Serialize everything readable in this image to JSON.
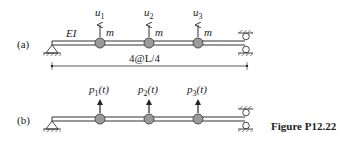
{
  "figure": {
    "caption": "Figure P12.22",
    "part_a": {
      "label": "(a)",
      "stiffness_label": "EI",
      "dofs": [
        {
          "name": "u",
          "sub": "1",
          "mass": "m"
        },
        {
          "name": "u",
          "sub": "2",
          "mass": "m"
        },
        {
          "name": "u",
          "sub": "3",
          "mass": "m"
        }
      ],
      "dimension": "4@L/4",
      "left_support": "pin",
      "right_support": "guided-roller"
    },
    "part_b": {
      "label": "(b)",
      "forces": [
        {
          "name": "p",
          "sub": "1",
          "arg": "(t)"
        },
        {
          "name": "p",
          "sub": "2",
          "arg": "(t)"
        },
        {
          "name": "p",
          "sub": "3",
          "arg": "(t)"
        }
      ]
    },
    "colors": {
      "line": "#333333",
      "mass_fill": "#9a9a9a",
      "background": "#ffffff"
    }
  }
}
